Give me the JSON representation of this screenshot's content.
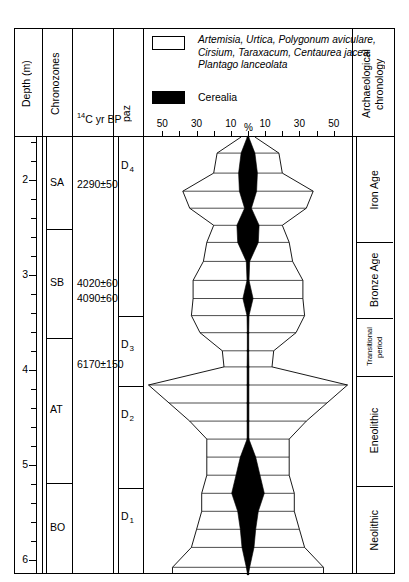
{
  "columns": {
    "depth_header": "Depth (m)",
    "chronozones_header": "Chronozones",
    "c14_header_sup": "14",
    "c14_header_rest": "C yr BP",
    "paz_header": "paz",
    "archaeology_header": "Archaeological\nchronology"
  },
  "legend": {
    "taxa_label": "Artemisia, Urtica, Polygonum aviculare, Cirsium, Taraxacum, Centaurea jacea, Plantago lanceolata",
    "cerealia_label": "Cerealia",
    "taxa_swatch_fill": "#ffffff",
    "cerealia_swatch_fill": "#000000"
  },
  "axis": {
    "percent_label": "%",
    "tick_labels": [
      "50",
      "30",
      "10",
      "10",
      "30",
      "50"
    ],
    "tick_values": [
      50,
      30,
      10,
      10,
      30,
      50
    ],
    "depth_labels": [
      "2",
      "3",
      "4",
      "5",
      "6"
    ],
    "depth_values": [
      2,
      3,
      4,
      5,
      6
    ],
    "depth_unit": "m"
  },
  "chronozones": [
    {
      "label": "SA",
      "top_depth": 1.55,
      "bottom_depth": 2.52
    },
    {
      "label": "SB",
      "top_depth": 2.52,
      "bottom_depth": 3.66
    },
    {
      "label": "AT",
      "top_depth": 3.66,
      "bottom_depth": 5.19
    },
    {
      "label": "BO",
      "top_depth": 5.19,
      "bottom_depth": 6.15
    }
  ],
  "c14_dates": [
    {
      "value": "2290±50",
      "depth": 2.05
    },
    {
      "value": "4020±60",
      "depth": 3.1
    },
    {
      "value": "4090±60",
      "depth": 3.25
    }
  ],
  "c14_dates_extra": [
    {
      "value": "6170±150",
      "depth": 3.95
    }
  ],
  "paz": [
    {
      "label": "D",
      "sub": "4",
      "top_depth": 1.55,
      "bottom_depth": 3.43
    },
    {
      "label": "D",
      "sub": "3",
      "top_depth": 3.43,
      "bottom_depth": 4.17
    },
    {
      "label": "D",
      "sub": "2",
      "top_depth": 4.17,
      "bottom_depth": 5.24
    },
    {
      "label": "D",
      "sub": "1",
      "top_depth": 5.24,
      "bottom_depth": 6.15
    }
  ],
  "archaeology": [
    {
      "label": "Iron Age",
      "top_depth": 1.55,
      "bottom_depth": 2.66
    },
    {
      "label": "Bronze Age",
      "top_depth": 2.66,
      "bottom_depth": 3.46
    },
    {
      "label": "Transitional period",
      "top_depth": 3.46,
      "bottom_depth": 4.07
    },
    {
      "label": "Eneolithic",
      "top_depth": 4.07,
      "bottom_depth": 5.22
    },
    {
      "label": "Neolithic",
      "top_depth": 5.22,
      "bottom_depth": 6.15
    }
  ],
  "chart_data": {
    "type": "area",
    "title": "",
    "xlabel": "%",
    "ylabel": "Depth (m)",
    "orientation": "vertical-mirrored",
    "xlim": [
      -60,
      60
    ],
    "ylim": [
      6.15,
      1.55
    ],
    "grid": false,
    "series": [
      {
        "name": "Artemisia, Urtica, Polygonum aviculare, Cirsium, Taraxacum, Centaurea jacea, Plantago lanceolata",
        "fill": "#ffffff",
        "stroke": "#000000",
        "depths": [
          1.55,
          1.72,
          1.93,
          2.12,
          2.3,
          2.48,
          2.66,
          2.86,
          3.06,
          3.25,
          3.43,
          3.61,
          3.8,
          3.97,
          4.16,
          4.35,
          4.54,
          4.73,
          4.92,
          5.11,
          5.3,
          5.49,
          5.68,
          5.87,
          6.08,
          6.15
        ],
        "values": [
          4,
          18,
          20,
          38,
          34,
          20,
          24,
          26,
          32,
          32,
          33,
          28,
          15,
          14,
          58,
          46,
          34,
          24,
          24,
          24,
          27,
          27,
          30,
          33,
          44,
          44
        ]
      },
      {
        "name": "Cerealia",
        "fill": "#000000",
        "stroke": "#000000",
        "depths": [
          1.55,
          1.72,
          1.93,
          2.12,
          2.3,
          2.48,
          2.66,
          2.86,
          3.06,
          3.25,
          3.43,
          3.61,
          3.8,
          3.97,
          4.16,
          4.35,
          4.54,
          4.73,
          4.92,
          5.11,
          5.3,
          5.49,
          5.68,
          5.87,
          6.08,
          6.15
        ],
        "values": [
          0.4,
          4.0,
          5.5,
          5.0,
          2.0,
          6.5,
          6.0,
          1.0,
          0.6,
          3.0,
          0.6,
          0.4,
          0.4,
          0.5,
          0.5,
          0.5,
          0.5,
          0.5,
          4.5,
          7.0,
          9.5,
          6.0,
          4.5,
          3.5,
          1.0,
          0.3
        ]
      }
    ]
  }
}
